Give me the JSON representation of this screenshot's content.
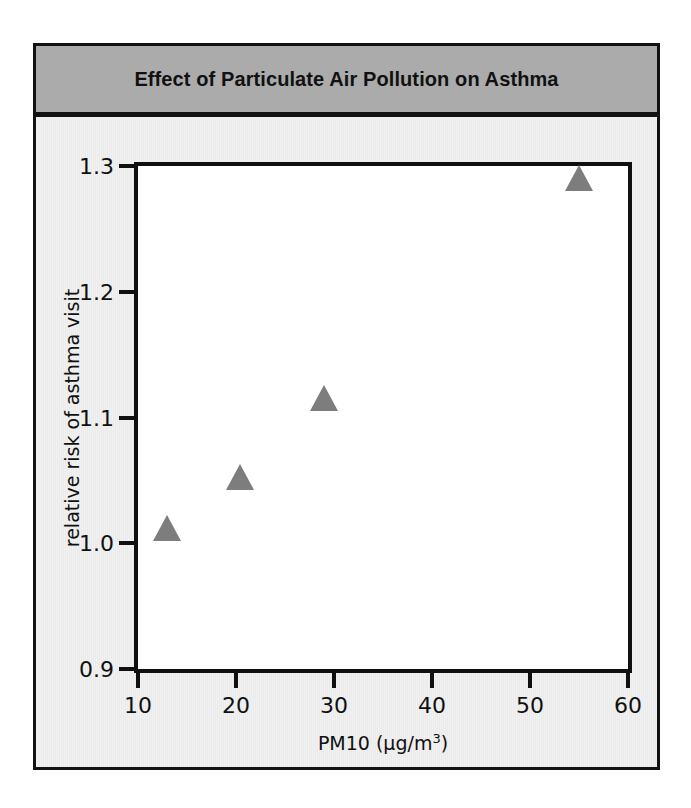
{
  "figure": {
    "title": "Effect of Particulate Air Pollution on Asthma",
    "title_band_color": "#ababab",
    "frame_color": "#121212",
    "paper_color": "#f1f1f1",
    "plot_background": "#ffffff",
    "marker_color": "#7d7d7d"
  },
  "chart_data": {
    "type": "scatter",
    "title": "Effect of Particulate Air Pollution on Asthma",
    "xlabel": "PM10 (µg/m³)",
    "ylabel": "relative risk of asthma visit",
    "xlim": [
      10,
      60
    ],
    "ylim": [
      0.9,
      1.3
    ],
    "xticks": [
      10,
      20,
      30,
      40,
      50,
      60
    ],
    "yticks": [
      0.9,
      1.0,
      1.1,
      1.2,
      1.3
    ],
    "xtick_labels": [
      "10",
      "20",
      "30",
      "40",
      "50",
      "60"
    ],
    "ytick_labels": [
      "0.9",
      "1.0",
      "1.1",
      "1.2",
      "1.3"
    ],
    "grid": false,
    "legend": false,
    "marker": "triangle",
    "points": [
      {
        "x": 13.0,
        "y": 1.002
      },
      {
        "x": 20.4,
        "y": 1.042
      },
      {
        "x": 29.0,
        "y": 1.105
      },
      {
        "x": 55.0,
        "y": 1.28
      }
    ]
  }
}
